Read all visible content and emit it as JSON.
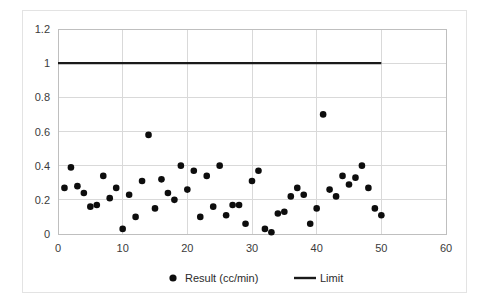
{
  "chart_data": {
    "type": "scatter",
    "title": "",
    "xlabel": "",
    "ylabel": "",
    "xlim": [
      0,
      60
    ],
    "ylim": [
      0,
      1.2
    ],
    "x_ticks": [
      0,
      10,
      20,
      30,
      40,
      50,
      60
    ],
    "y_ticks": [
      0,
      0.2,
      0.4,
      0.6,
      0.8,
      1,
      1.2
    ],
    "x_tick_labels": [
      "0",
      "10",
      "20",
      "30",
      "40",
      "50",
      "60"
    ],
    "y_tick_labels": [
      "0",
      "0.2",
      "0.4",
      "0.6",
      "0.8",
      "1",
      "1.2"
    ],
    "grid": "horizontal-and-vertical",
    "legend_position": "bottom-center",
    "marker_color": "#0d0d0d",
    "line_color": "#1a1a1a",
    "series": [
      {
        "name": "Result (cc/min)",
        "type": "scatter",
        "marker": "circle",
        "color": "#0d0d0d",
        "x": [
          1,
          2,
          3,
          4,
          5,
          6,
          7,
          8,
          9,
          10,
          11,
          12,
          13,
          14,
          15,
          16,
          17,
          18,
          19,
          20,
          21,
          22,
          23,
          24,
          25,
          26,
          27,
          28,
          29,
          30,
          31,
          32,
          33,
          34,
          35,
          36,
          37,
          38,
          39,
          40,
          41,
          42,
          43,
          44,
          45,
          46,
          47,
          48,
          49,
          50
        ],
        "values": [
          0.27,
          0.39,
          0.28,
          0.24,
          0.16,
          0.17,
          0.34,
          0.21,
          0.27,
          0.03,
          0.23,
          0.1,
          0.31,
          0.58,
          0.15,
          0.32,
          0.24,
          0.2,
          0.4,
          0.26,
          0.37,
          0.1,
          0.34,
          0.16,
          0.4,
          0.11,
          0.17,
          0.17,
          0.06,
          0.31,
          0.37,
          0.03,
          0.01,
          0.12,
          0.13,
          0.22,
          0.27,
          0.23,
          0.06,
          0.15,
          0.7,
          0.26,
          0.22,
          0.34,
          0.29,
          0.33,
          0.4,
          0.27,
          0.15,
          0.11
        ]
      },
      {
        "name": "Limit",
        "type": "line",
        "color": "#1a1a1a",
        "x": [
          0,
          50
        ],
        "values": [
          1,
          1
        ]
      }
    ],
    "legend": [
      {
        "label": "Result (cc/min)",
        "marker": "circle",
        "color": "#0d0d0d"
      },
      {
        "label": "Limit",
        "marker": "line",
        "color": "#1a1a1a"
      }
    ]
  }
}
